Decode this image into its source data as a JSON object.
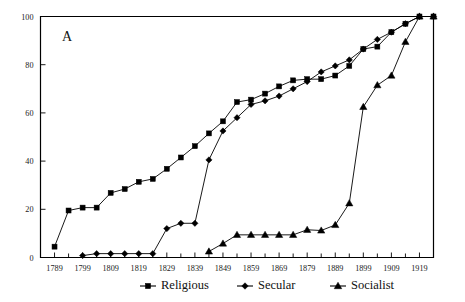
{
  "chart_data": {
    "type": "line",
    "title": "",
    "panel_label": "A",
    "xlabel": "",
    "ylabel": "",
    "xlim": [
      1784,
      1924
    ],
    "ylim": [
      0,
      100
    ],
    "grid": false,
    "legend_position": "bottom",
    "y_ticks": [
      0,
      20,
      40,
      60,
      80,
      100
    ],
    "y_tick_labels": [
      "0",
      "20",
      "40",
      "60",
      "80",
      "100"
    ],
    "x_major_ticks": [
      1789,
      1799,
      1809,
      1819,
      1829,
      1839,
      1849,
      1859,
      1869,
      1879,
      1889,
      1899,
      1909,
      1919
    ],
    "x_tick_labels": [
      "1789",
      "1799",
      "1809",
      "1819",
      "1829",
      "1839",
      "1849",
      "1859",
      "1869",
      "1879",
      "1889",
      "1899",
      "1909",
      "1919"
    ],
    "x_minor_ticks": [
      1794,
      1804,
      1814,
      1824,
      1834,
      1844,
      1854,
      1864,
      1874,
      1884,
      1894,
      1904,
      1914,
      1924
    ],
    "series": [
      {
        "name": "Religious",
        "marker": "square",
        "x": [
          1789,
          1794,
          1799,
          1804,
          1809,
          1814,
          1819,
          1824,
          1829,
          1834,
          1839,
          1844,
          1849,
          1854,
          1859,
          1864,
          1869,
          1874,
          1879,
          1884,
          1889,
          1894,
          1899,
          1904,
          1909,
          1914,
          1919,
          1924
        ],
        "values": [
          4.5,
          19.5,
          20.7,
          20.7,
          26.8,
          28.4,
          31.4,
          32.6,
          36.8,
          41.5,
          46.2,
          51.5,
          56.5,
          64.5,
          65.5,
          68.0,
          71.0,
          73.5,
          74.0,
          74.0,
          75.5,
          79.5,
          86.5,
          87.5,
          93.5,
          97.0,
          100.0,
          100.0
        ]
      },
      {
        "name": "Secular",
        "marker": "diamond",
        "x": [
          1799,
          1804,
          1809,
          1814,
          1819,
          1824,
          1829,
          1834,
          1839,
          1844,
          1849,
          1854,
          1859,
          1864,
          1869,
          1874,
          1879,
          1884,
          1889,
          1894,
          1899,
          1904,
          1909,
          1914,
          1919,
          1924
        ],
        "values": [
          0.8,
          1.6,
          1.6,
          1.6,
          1.6,
          1.6,
          12.0,
          14.2,
          14.2,
          40.5,
          52.5,
          58.0,
          63.5,
          65.0,
          67.0,
          70.0,
          73.0,
          77.0,
          79.5,
          82.0,
          86.5,
          90.5,
          93.5,
          97.0,
          100.0,
          100.0
        ]
      },
      {
        "name": "Socialist",
        "marker": "triangle",
        "x": [
          1844,
          1849,
          1854,
          1859,
          1864,
          1869,
          1874,
          1879,
          1884,
          1889,
          1894,
          1899,
          1904,
          1909,
          1914,
          1919,
          1924
        ],
        "values": [
          2.5,
          5.8,
          9.4,
          9.4,
          9.4,
          9.4,
          9.4,
          11.5,
          11.2,
          13.5,
          22.5,
          62.5,
          71.5,
          75.5,
          89.5,
          100.0,
          100.0
        ]
      }
    ],
    "legend": [
      {
        "label": "Religious",
        "marker": "square"
      },
      {
        "label": "Secular",
        "marker": "diamond"
      },
      {
        "label": "Socialist",
        "marker": "triangle"
      }
    ]
  }
}
